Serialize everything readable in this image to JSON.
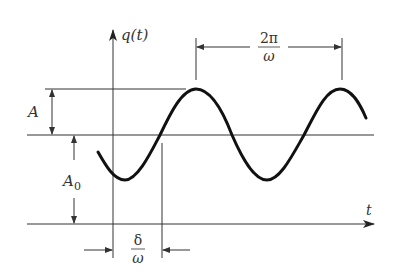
{
  "diagram": {
    "type": "sinusoid-with-offset",
    "y_axis_label": "q(t)",
    "x_axis_label": "t",
    "amplitude_label": "A",
    "offset_label": "A",
    "offset_subscript": "0",
    "period_label": {
      "numerator": "2π",
      "denominator": "ω"
    },
    "phase_label": {
      "numerator": "δ",
      "denominator": "ω"
    },
    "colors": {
      "line": "#333333",
      "curve": "#111111",
      "background": "#ffffff"
    }
  }
}
